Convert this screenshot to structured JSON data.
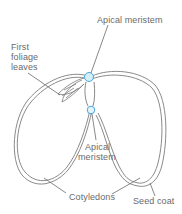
{
  "diagram": {
    "type": "labeled-illustration",
    "colors": {
      "outline": "#8a8a8a",
      "meristem_fill": "#d6eef8",
      "meristem_stroke": "#4aa8d8",
      "label_text": "#6a6a6a",
      "leader_line": "#6a6a6a"
    },
    "labels": {
      "apical_meristem_top": "Apical meristem",
      "first_foliage_leaves_line1": "First",
      "first_foliage_leaves_line2": "foliage",
      "first_foliage_leaves_line3": "leaves",
      "apical_meristem_bottom_line1": "Apical",
      "apical_meristem_bottom_line2": "meristem",
      "cotyledons": "Cotyledons",
      "seed_coat": "Seed coat"
    }
  }
}
